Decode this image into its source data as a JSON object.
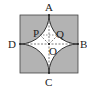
{
  "diagram": {
    "type": "geometry",
    "colors": {
      "shaded": "#b3b3b3",
      "star_fill": "#ffffff",
      "stroke": "#333333"
    },
    "labels": {
      "A": "A",
      "B": "B",
      "C": "C",
      "D": "D",
      "P": "P",
      "Q": "Q",
      "O": "O"
    }
  }
}
